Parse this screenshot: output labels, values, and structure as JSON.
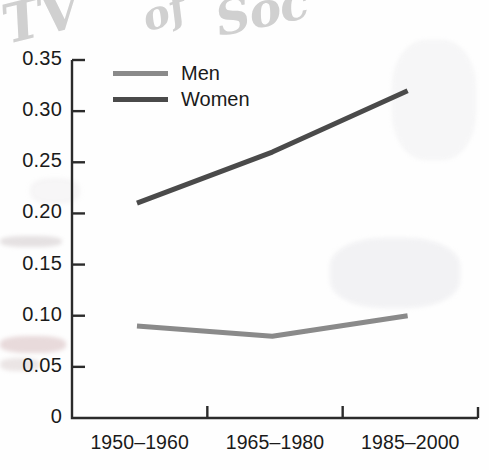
{
  "figure": {
    "background_color": "#fefefe",
    "axis_color": "#2b2b2b"
  },
  "scan_artifacts": {
    "description": "faint handwritten cursive bleed-through across top of scanned page",
    "handwriting": [
      {
        "text": "TV",
        "color": "#c8c8c8"
      },
      {
        "text": "of",
        "color": "#c8c8c8"
      },
      {
        "text": "Soc",
        "color": "#c8c8c8"
      }
    ]
  },
  "chart_data": {
    "type": "line",
    "title": "",
    "xlabel": "",
    "ylabel": "",
    "categories": [
      "1950–1960",
      "1965–1980",
      "1985–2000"
    ],
    "series": [
      {
        "name": "Men",
        "values": [
          0.09,
          0.08,
          0.1
        ],
        "color": "#8a8a8a"
      },
      {
        "name": "Women",
        "values": [
          0.21,
          0.26,
          0.32
        ],
        "color": "#4a4a4a"
      }
    ],
    "ylim": [
      0,
      0.35
    ],
    "ytick_values": [
      0,
      0.05,
      0.1,
      0.15,
      0.2,
      0.25,
      0.3,
      0.35
    ],
    "ytick_labels": [
      "0",
      "0.05",
      "0.10",
      "0.15",
      "0.20",
      "0.25",
      "0.30",
      "0.35"
    ],
    "grid": false,
    "legend_position": "top-left-inside",
    "legend_entries": [
      "Men",
      "Women"
    ]
  }
}
